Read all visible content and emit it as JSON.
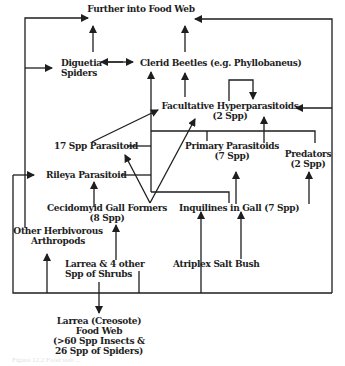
{
  "diagram": {
    "type": "food-web",
    "nodes": {
      "further": {
        "label": "Further into Food Web"
      },
      "diguetia": {
        "line1": "Diguetia",
        "line2": "Spiders"
      },
      "clerid": {
        "label": "Clerid Beetles (e.g. Phyllobaneus)"
      },
      "facultative": {
        "line1": "Facultative Hyperparasitoids",
        "line2": "(2 Spp)"
      },
      "parasitoid17": {
        "label": "17 Spp  Parasitoid"
      },
      "primary": {
        "line1": "Primary Parasitoids",
        "line2": "(7 Spp)"
      },
      "predators": {
        "line1": "Predators",
        "line2": "(2 Spp)"
      },
      "rileya": {
        "label": "Rileya Parasitoid"
      },
      "cecidomyid": {
        "line1": "Cecidomyid Gall Formers",
        "line2": "(8 Spp)"
      },
      "inquilines": {
        "label": "Inquilines in Gall (7 Spp)"
      },
      "herbivorous": {
        "line1": "Other Herbivorous",
        "line2": "Arthropods"
      },
      "larrea_shrubs": {
        "line1": "Larrea & 4 other",
        "line2": "Spp of Shrubs"
      },
      "atriplex": {
        "label": "Atriplex Salt Bush"
      },
      "creosote": {
        "line1": "Larrea (Creosote)",
        "line2": "Food Web",
        "line3": "(>60 Spp Insects &",
        "line4": "26 Spp of Spiders)"
      }
    },
    "edges": [
      [
        "Diguetia Spiders",
        "Further into Food Web"
      ],
      [
        "Clerid Beetles",
        "Further into Food Web"
      ],
      [
        "Diguetia Spiders",
        "Clerid Beetles",
        "bidirectional"
      ],
      [
        "Facultative Hyperparasitoids",
        "Clerid Beetles"
      ],
      [
        "Facultative Hyperparasitoids",
        "Facultative Hyperparasitoids",
        "self-loop"
      ],
      [
        "Primary Parasitoids",
        "Facultative Hyperparasitoids"
      ],
      [
        "Cecidomyid Gall Formers",
        "Facultative Hyperparasitoids"
      ],
      [
        "17 Spp Parasitoid",
        "Facultative Hyperparasitoids"
      ],
      [
        "Cecidomyid Gall Formers",
        "17 Spp Parasitoid"
      ],
      [
        "Cecidomyid Gall Formers",
        "Rileya Parasitoid"
      ],
      [
        "Inquilines in Gall",
        "Primary Parasitoids"
      ],
      [
        "Larrea & 4 other Spp of Shrubs",
        "Cecidomyid Gall Formers"
      ],
      [
        "Atriplex Salt Bush",
        "Inquilines in Gall"
      ],
      [
        "Larrea & 4 other Spp of Shrubs",
        "Larrea (Creosote) Food Web"
      ],
      [
        "Other Herbivorous Arthropods",
        "Further into Food Web"
      ],
      [
        "Other Herbivorous Arthropods",
        "Rileya Parasitoid"
      ],
      [
        "Predators",
        "Facultative Hyperparasitoids"
      ]
    ],
    "colors": {
      "line": "#1e1e1e",
      "text": "#1e1e1e",
      "background": "#ffffff"
    }
  },
  "caption": "Figure 12.2  Food web ..."
}
